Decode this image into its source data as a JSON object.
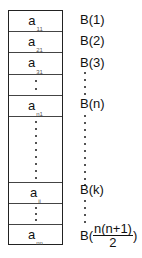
{
  "diagram": {
    "type": "array-storage-mapping",
    "array_cells": [
      {
        "id": "a11",
        "base": "a",
        "sub": "11",
        "top": 0,
        "height": 20
      },
      {
        "id": "a21",
        "base": "a",
        "sub": "21",
        "top": 20,
        "height": 21
      },
      {
        "id": "a31",
        "base": "a",
        "sub": "31",
        "top": 41,
        "height": 22
      },
      {
        "id": "gap1",
        "base": "",
        "sub": "",
        "top": 63,
        "height": 21,
        "dots": 2
      },
      {
        "id": "an1",
        "base": "a",
        "sub": "n1",
        "top": 84,
        "height": 21
      },
      {
        "id": "gap2",
        "base": "",
        "sub": "",
        "top": 105,
        "height": 66,
        "dots": 9
      },
      {
        "id": "aij",
        "base": "a",
        "sub": "ij",
        "top": 171,
        "height": 21
      },
      {
        "id": "gap3",
        "base": "",
        "sub": "",
        "top": 192,
        "height": 21,
        "dots": 3
      },
      {
        "id": "ann",
        "base": "a",
        "sub": "nn",
        "top": 213,
        "height": 20
      }
    ],
    "b_labels": [
      {
        "id": "b1",
        "text": "B(1)",
        "top": 13
      },
      {
        "id": "b2",
        "text": "B(2)",
        "top": 34
      },
      {
        "id": "b3",
        "text": "B(3)",
        "top": 56
      },
      {
        "id": "bn",
        "text": "B(n)",
        "top": 97
      },
      {
        "id": "bk",
        "text": "B(k)",
        "top": 183
      }
    ],
    "b_last": {
      "prefix": "B(",
      "numerator": "n(n+1)",
      "denominator": "2",
      "suffix": ")"
    },
    "colors": {
      "border": "#222222",
      "text": "#111111",
      "subscript": "#555555"
    }
  }
}
